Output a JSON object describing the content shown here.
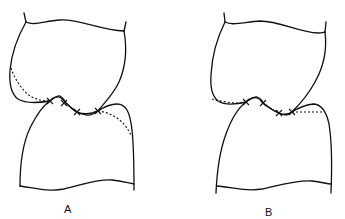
{
  "figure": {
    "type": "dental occlusion line drawing",
    "panels": [
      {
        "id": "A",
        "label": "A",
        "description": "Upper and lower teeth in occlusion; dotted lines show altered contour on upper-left and lower-right; four X contact marks along occlusal line"
      },
      {
        "id": "B",
        "label": "B",
        "description": "Upper and lower teeth in occlusion; dotted lines show flattened contour on upper-left and lower-right; four X contact marks along occlusal line"
      }
    ],
    "colors": {
      "line": "#111111",
      "background": "#ffffff"
    }
  }
}
